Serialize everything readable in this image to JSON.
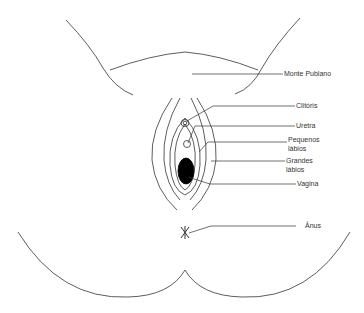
{
  "diagram": {
    "type": "anatomical line drawing",
    "line_color": "#333333",
    "labels": [
      {
        "id": "monte-pubiano",
        "text": "Monte Publano"
      },
      {
        "id": "clitoris",
        "text": "Clitóris"
      },
      {
        "id": "uretra",
        "text": "Uretra"
      },
      {
        "id": "pequenos-labios",
        "line1": "Pequenos",
        "line2": "lábios"
      },
      {
        "id": "grandes-labios",
        "line1": "Grandes",
        "line2": "lábios"
      },
      {
        "id": "vagina",
        "text": "Vagina"
      },
      {
        "id": "anus",
        "text": "Ânus"
      }
    ]
  }
}
